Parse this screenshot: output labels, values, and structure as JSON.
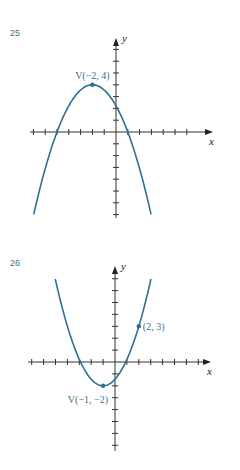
{
  "chart_data": [
    {
      "type": "line",
      "title": "25",
      "xlabel": "x",
      "ylabel": "y",
      "xlim": [
        -7,
        7
      ],
      "ylim": [
        -7,
        7
      ],
      "xticks": [
        -7,
        -6,
        -5,
        -4,
        -3,
        -2,
        -1,
        1,
        2,
        3,
        4,
        5,
        6
      ],
      "yticks": [
        -7,
        -6,
        -5,
        -4,
        -3,
        -2,
        -1,
        1,
        2,
        3,
        4,
        5,
        6,
        7
      ],
      "grid": false,
      "curve": {
        "kind": "parabola",
        "a": -0.4444,
        "h": -2,
        "k": 4,
        "x_range": [
          -6.97,
          2.97
        ]
      },
      "points": [
        {
          "x": -2,
          "y": 4,
          "label": "V(−2, 4)",
          "label_pos": "above"
        }
      ]
    },
    {
      "type": "line",
      "title": "26",
      "xlabel": "x",
      "ylabel": "y",
      "xlim": [
        -7,
        7
      ],
      "ylim": [
        -7,
        7
      ],
      "xticks": [
        -7,
        -6,
        -5,
        -4,
        -3,
        -2,
        -1,
        1,
        2,
        3,
        4,
        5,
        6,
        7
      ],
      "yticks": [
        -7,
        -6,
        -5,
        -4,
        -3,
        -2,
        -1,
        1,
        2,
        3,
        4,
        5,
        6,
        7
      ],
      "grid": false,
      "curve": {
        "kind": "parabola",
        "a": 0.5556,
        "h": -1,
        "k": -2,
        "x_range": [
          -5.02,
          3.02
        ]
      },
      "points": [
        {
          "x": -1,
          "y": -2,
          "label": "V(−1, −2)",
          "label_pos": "left-below"
        },
        {
          "x": 2,
          "y": 3,
          "label": "(2, 3)",
          "label_pos": "right"
        }
      ]
    }
  ]
}
